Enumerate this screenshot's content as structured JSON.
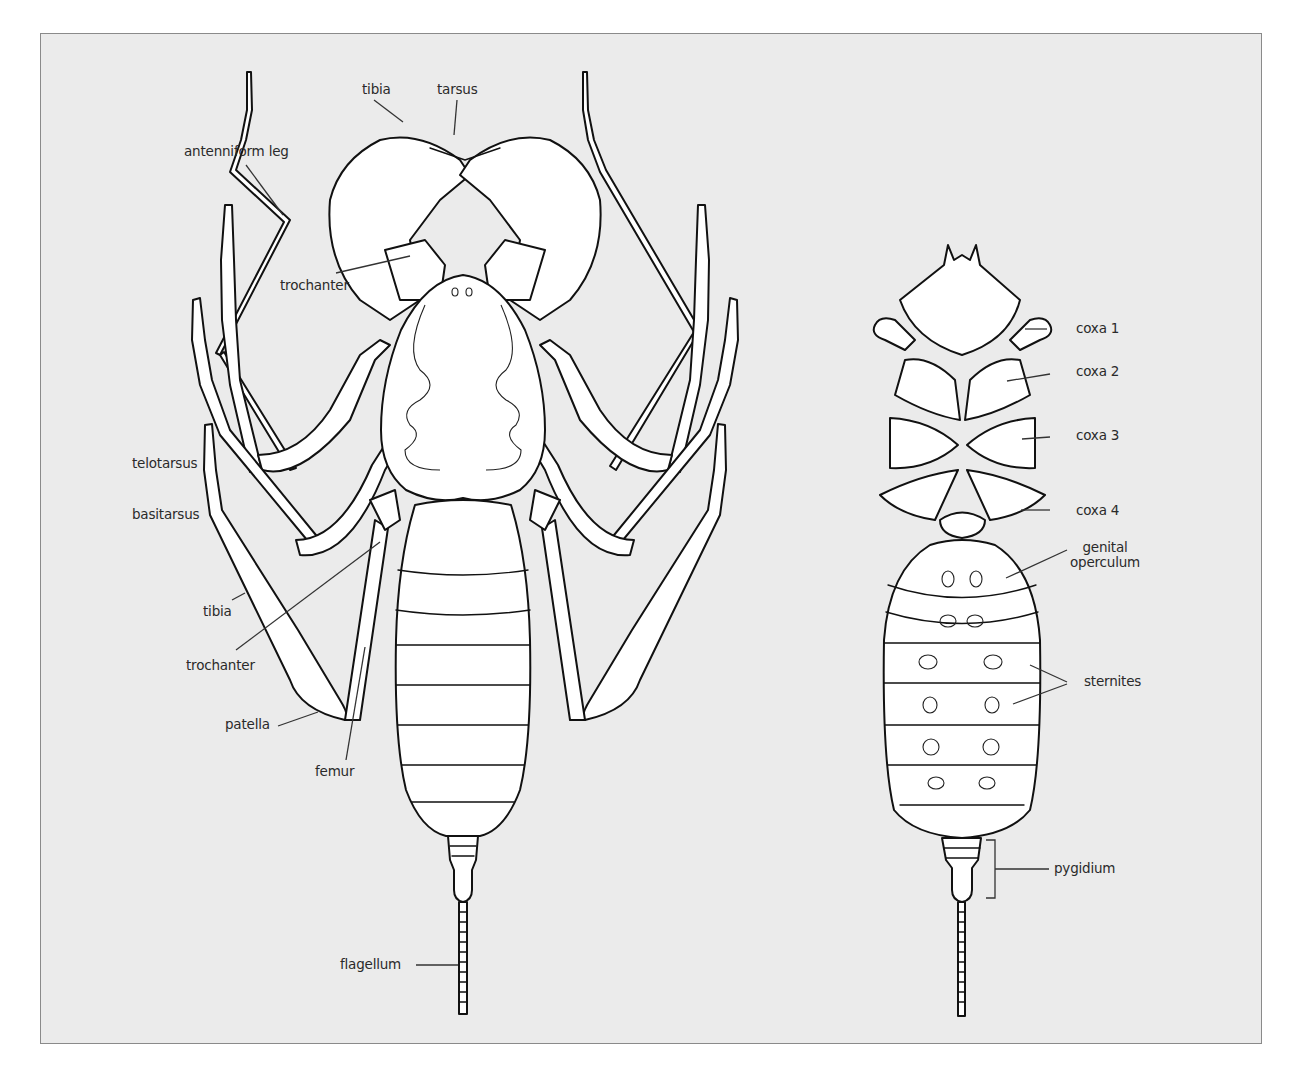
{
  "figure": {
    "background_color": "#ebebeb",
    "frame_color": "#8a8a8a",
    "outline_color": "#111111",
    "fill_color": "#ffffff"
  },
  "dorsal_view": {
    "labels": {
      "tibia_top": "tibia",
      "tarsus": "tarsus",
      "antenniform_leg": "antenniform leg",
      "trochanter_top": "trochanter",
      "telotarsus": "telotarsus",
      "basitarsus": "basitarsus",
      "tibia_leg": "tibia",
      "trochanter_leg": "trochanter",
      "patella": "patella",
      "femur": "femur",
      "flagellum": "flagellum"
    }
  },
  "ventral_view": {
    "labels": {
      "coxa_1": "coxa 1",
      "coxa_2": "coxa 2",
      "coxa_3": "coxa 3",
      "coxa_4": "coxa 4",
      "genital_operculum_line1": "genital",
      "genital_operculum_line2": "operculum",
      "sternites": "sternites",
      "pygidium": "pygidium"
    }
  }
}
